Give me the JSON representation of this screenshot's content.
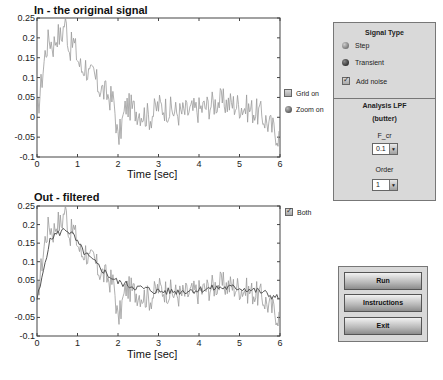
{
  "plots": [
    {
      "title": "In - the original signal",
      "xlabel": "Time [sec]",
      "x_ticks": [
        "0",
        "1",
        "2",
        "3",
        "4",
        "5",
        "6"
      ],
      "y_ticks": [
        "0.25",
        "0.2",
        "0.15",
        "0.1",
        "0.05",
        "0",
        "-0.05",
        "-0.1"
      ],
      "xlim": [
        0,
        6
      ],
      "ylim": [
        -0.1,
        0.25
      ]
    },
    {
      "title": "Out - filtered",
      "xlabel": "Time [sec]",
      "x_ticks": [
        "0",
        "1",
        "2",
        "3",
        "4",
        "5",
        "6"
      ],
      "y_ticks": [
        "0.25",
        "0.2",
        "0.15",
        "0.1",
        "0.05",
        "0",
        "-0.05",
        "-0.1"
      ],
      "xlim": [
        0,
        6
      ],
      "ylim": [
        -0.1,
        0.25
      ]
    }
  ],
  "chart_data": [
    {
      "type": "line",
      "title": "In - the original signal",
      "xlabel": "Time [sec]",
      "ylabel": "",
      "xlim": [
        0,
        6
      ],
      "ylim": [
        -0.1,
        0.25
      ],
      "series": [
        {
          "name": "input (noisy)",
          "x": [
            0,
            0.1,
            0.2,
            0.3,
            0.4,
            0.5,
            0.6,
            0.7,
            0.8,
            0.9,
            1.0,
            1.1,
            1.2,
            1.3,
            1.4,
            1.5,
            1.6,
            1.7,
            1.8,
            1.9,
            2.0,
            2.2,
            2.4,
            2.6,
            2.8,
            3.0,
            3.5,
            4.0,
            4.5,
            5.0,
            5.5,
            6.0
          ],
          "y": [
            0,
            0.08,
            0.16,
            0.2,
            0.18,
            0.21,
            0.2,
            0.25,
            0.17,
            0.19,
            0.15,
            0.12,
            0.13,
            0.1,
            0.11,
            0.08,
            0.07,
            0.06,
            0.05,
            0.04,
            -0.06,
            0.03,
            0.02,
            0.01,
            0.0,
            0.03,
            0.01,
            0.02,
            0.04,
            0.03,
            0.01,
            -0.05
          ]
        }
      ]
    },
    {
      "type": "line",
      "title": "Out - filtered",
      "xlabel": "Time [sec]",
      "ylabel": "",
      "xlim": [
        0,
        6
      ],
      "ylim": [
        -0.1,
        0.25
      ],
      "series": [
        {
          "name": "input (noisy)",
          "x": [
            0,
            0.1,
            0.2,
            0.3,
            0.4,
            0.5,
            0.6,
            0.7,
            0.8,
            0.9,
            1.0,
            1.1,
            1.2,
            1.3,
            1.4,
            1.5,
            1.6,
            1.7,
            1.8,
            1.9,
            2.0,
            2.2,
            2.4,
            2.6,
            2.8,
            3.0,
            3.5,
            4.0,
            4.5,
            5.0,
            5.5,
            6.0
          ],
          "y": [
            0,
            0.08,
            0.16,
            0.2,
            0.18,
            0.21,
            0.2,
            0.25,
            0.17,
            0.19,
            0.15,
            0.12,
            0.13,
            0.1,
            0.11,
            0.08,
            0.07,
            0.06,
            0.05,
            0.04,
            -0.06,
            0.03,
            0.02,
            0.01,
            0.0,
            0.03,
            0.01,
            0.02,
            0.04,
            0.03,
            0.01,
            -0.05
          ]
        },
        {
          "name": "filtered",
          "x": [
            0,
            0.1,
            0.2,
            0.3,
            0.4,
            0.5,
            0.6,
            0.7,
            0.8,
            0.9,
            1.0,
            1.2,
            1.4,
            1.6,
            1.8,
            2.0,
            2.5,
            3.0,
            3.5,
            4.0,
            4.5,
            5.0,
            5.5,
            6.0
          ],
          "y": [
            0,
            0.04,
            0.1,
            0.15,
            0.17,
            0.175,
            0.18,
            0.19,
            0.18,
            0.17,
            0.15,
            0.12,
            0.1,
            0.08,
            0.06,
            0.045,
            0.03,
            0.02,
            0.02,
            0.025,
            0.03,
            0.03,
            0.02,
            0.0
          ]
        }
      ]
    }
  ],
  "controls": {
    "grid_on": {
      "label": "Grid on",
      "checked": false
    },
    "zoom_on": {
      "label": "Zoom on"
    },
    "both": {
      "label": "Both",
      "checked": true
    }
  },
  "signal_panel": {
    "title": "Signal Type",
    "options": [
      "Step",
      "Transient"
    ],
    "selected": "Transient",
    "add_noise": {
      "label": "Add noise",
      "checked": true
    }
  },
  "lpf_panel": {
    "title": "Analysis LPF",
    "subtitle": "(butter)",
    "fcr_label": "F_cr",
    "fcr_value": "0.1",
    "order_label": "Order",
    "order_value": "1"
  },
  "buttons": {
    "run": "Run",
    "instructions": "Instructions",
    "exit": "Exit"
  },
  "colors": {
    "panel_bg": "#d9d9d9",
    "raw_line": "#9a9a9a",
    "filtered_line": "#555555"
  }
}
